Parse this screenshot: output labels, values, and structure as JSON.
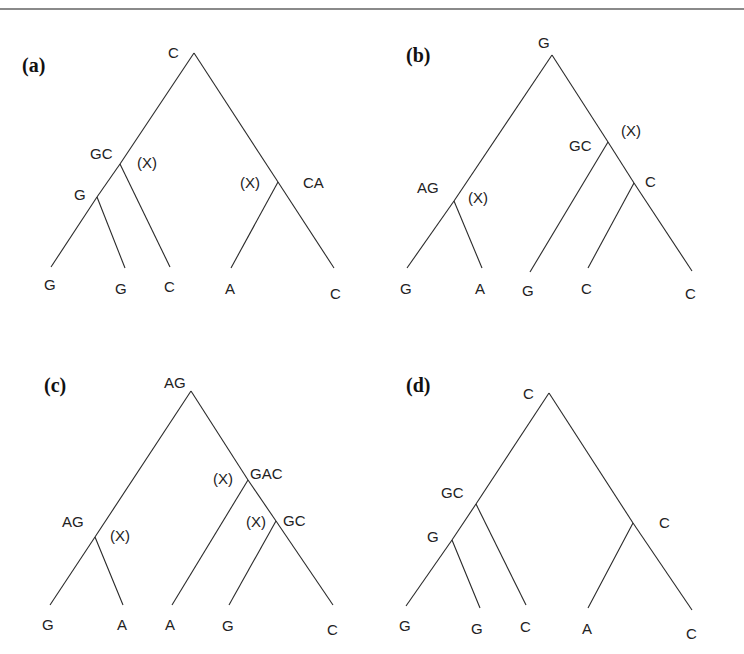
{
  "figure": {
    "panels": [
      {
        "id": "a",
        "label": "(a)",
        "label_pos": [
          22,
          72
        ],
        "nodes": [
          {
            "id": "root",
            "x": 194,
            "y": 53,
            "label": "C",
            "lx": 168,
            "ly": 58
          },
          {
            "id": "n1",
            "x": 120,
            "y": 164,
            "label": "GC",
            "lx": 90,
            "ly": 159
          },
          {
            "id": "n2",
            "x": 97,
            "y": 197,
            "label": "G",
            "lx": 74,
            "ly": 200
          },
          {
            "id": "n3",
            "x": 278,
            "y": 182,
            "label": "CA",
            "lx": 303,
            "ly": 188
          }
        ],
        "leaves": [
          {
            "x": 51,
            "y": 267,
            "label": "G",
            "lx": 44,
            "ly": 290
          },
          {
            "x": 125,
            "y": 268,
            "label": "G",
            "lx": 115,
            "ly": 294
          },
          {
            "x": 170,
            "y": 267,
            "label": "C",
            "lx": 164,
            "ly": 292
          },
          {
            "x": 231,
            "y": 268,
            "label": "A",
            "lx": 225,
            "ly": 294
          },
          {
            "x": 334,
            "y": 268,
            "label": "C",
            "lx": 330,
            "ly": 299
          }
        ],
        "edges": [
          [
            "root",
            "n1"
          ],
          [
            "n1",
            "n2"
          ],
          [
            "n2",
            "L0"
          ],
          [
            "n2",
            "L1"
          ],
          [
            "n1",
            "L2"
          ],
          [
            "root",
            "n3"
          ],
          [
            "n3",
            "L3"
          ],
          [
            "n3",
            "L4"
          ]
        ],
        "marks": [
          {
            "text": "(X)",
            "x": 137,
            "y": 168
          },
          {
            "text": "(X)",
            "x": 240,
            "y": 188
          }
        ]
      },
      {
        "id": "b",
        "label": "(b)",
        "label_pos": [
          406,
          62
        ],
        "nodes": [
          {
            "id": "root",
            "x": 552,
            "y": 55,
            "label": "G",
            "lx": 538,
            "ly": 48
          },
          {
            "id": "n1",
            "x": 454,
            "y": 201,
            "label": "AG",
            "lx": 417,
            "ly": 193
          },
          {
            "id": "n2",
            "x": 608,
            "y": 142,
            "label": "GC",
            "lx": 569,
            "ly": 151
          },
          {
            "id": "n3",
            "x": 634,
            "y": 183,
            "label": "C",
            "lx": 645,
            "ly": 187
          }
        ],
        "leaves": [
          {
            "x": 407,
            "y": 268,
            "label": "G",
            "lx": 400,
            "ly": 294
          },
          {
            "x": 482,
            "y": 268,
            "label": "A",
            "lx": 475,
            "ly": 294
          },
          {
            "x": 530,
            "y": 272,
            "label": "G",
            "lx": 522,
            "ly": 296
          },
          {
            "x": 588,
            "y": 268,
            "label": "C",
            "lx": 581,
            "ly": 294
          },
          {
            "x": 692,
            "y": 271,
            "label": "C",
            "lx": 685,
            "ly": 299
          }
        ],
        "edges": [
          [
            "root",
            "n1"
          ],
          [
            "n1",
            "L0"
          ],
          [
            "n1",
            "L1"
          ],
          [
            "root",
            "n2"
          ],
          [
            "n2",
            "L2"
          ],
          [
            "n2",
            "n3"
          ],
          [
            "n3",
            "L3"
          ],
          [
            "n3",
            "L4"
          ]
        ],
        "marks": [
          {
            "text": "(X)",
            "x": 621,
            "y": 136
          },
          {
            "text": "(X)",
            "x": 468,
            "y": 203
          }
        ]
      },
      {
        "id": "c",
        "label": "(c)",
        "label_pos": [
          44,
          392
        ],
        "nodes": [
          {
            "id": "root",
            "x": 191,
            "y": 391,
            "label": "AG",
            "lx": 164,
            "ly": 388
          },
          {
            "id": "n1",
            "x": 95,
            "y": 537,
            "label": "AG",
            "lx": 62,
            "ly": 527
          },
          {
            "id": "n2",
            "x": 248,
            "y": 480,
            "label": "GAC",
            "lx": 250,
            "ly": 479
          },
          {
            "id": "n3",
            "x": 276,
            "y": 521,
            "label": "GC",
            "lx": 283,
            "ly": 526
          }
        ],
        "leaves": [
          {
            "x": 50,
            "y": 605,
            "label": "G",
            "lx": 42,
            "ly": 630
          },
          {
            "x": 123,
            "y": 605,
            "label": "A",
            "lx": 117,
            "ly": 630
          },
          {
            "x": 172,
            "y": 605,
            "label": "A",
            "lx": 165,
            "ly": 630
          },
          {
            "x": 229,
            "y": 605,
            "label": "G",
            "lx": 222,
            "ly": 631
          },
          {
            "x": 333,
            "y": 605,
            "label": "C",
            "lx": 327,
            "ly": 635
          }
        ],
        "edges": [
          [
            "root",
            "n1"
          ],
          [
            "n1",
            "L0"
          ],
          [
            "n1",
            "L1"
          ],
          [
            "root",
            "n2"
          ],
          [
            "n2",
            "L2"
          ],
          [
            "n2",
            "n3"
          ],
          [
            "n3",
            "L3"
          ],
          [
            "n3",
            "L4"
          ]
        ],
        "marks": [
          {
            "text": "(X)",
            "x": 110,
            "y": 541
          },
          {
            "text": "(X)",
            "x": 213,
            "y": 484
          },
          {
            "text": "(X)",
            "x": 246,
            "y": 527
          }
        ]
      },
      {
        "id": "d",
        "label": "(d)",
        "label_pos": [
          406,
          392
        ],
        "nodes": [
          {
            "id": "root",
            "x": 549,
            "y": 393,
            "label": "C",
            "lx": 523,
            "ly": 399
          },
          {
            "id": "n1",
            "x": 476,
            "y": 504,
            "label": "GC",
            "lx": 441,
            "ly": 498
          },
          {
            "id": "n2",
            "x": 452,
            "y": 540,
            "label": "G",
            "lx": 427,
            "ly": 542
          },
          {
            "id": "n3",
            "x": 633,
            "y": 523,
            "label": "C",
            "lx": 659,
            "ly": 528
          }
        ],
        "leaves": [
          {
            "x": 406,
            "y": 606,
            "label": "G",
            "lx": 399,
            "ly": 631
          },
          {
            "x": 480,
            "y": 608,
            "label": "G",
            "lx": 471,
            "ly": 634
          },
          {
            "x": 526,
            "y": 605,
            "label": "C",
            "lx": 520,
            "ly": 632
          },
          {
            "x": 588,
            "y": 608,
            "label": "A",
            "lx": 582,
            "ly": 634
          },
          {
            "x": 692,
            "y": 610,
            "label": "C",
            "lx": 686,
            "ly": 639
          }
        ],
        "edges": [
          [
            "root",
            "n1"
          ],
          [
            "n1",
            "n2"
          ],
          [
            "n2",
            "L0"
          ],
          [
            "n2",
            "L1"
          ],
          [
            "n1",
            "L2"
          ],
          [
            "root",
            "n3"
          ],
          [
            "n3",
            "L3"
          ],
          [
            "n3",
            "L4"
          ]
        ],
        "marks": []
      }
    ]
  }
}
